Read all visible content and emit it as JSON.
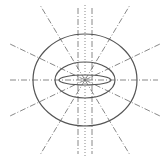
{
  "diagram": {
    "title": "",
    "colors": {
      "ellipse_stroke": "#555555",
      "field_line_stroke": "#6a6a6a",
      "background": "#ffffff"
    },
    "center": {
      "x": 85,
      "y": 80
    },
    "ellipses": [
      {
        "name": "outer-ellipse",
        "rx": 52,
        "ry": 46
      },
      {
        "name": "middle-ellipse",
        "rx": 30,
        "ry": 18
      },
      {
        "name": "inner-ellipse",
        "rx": 26,
        "ry": 5
      }
    ],
    "field_lines": [
      {
        "name": "horizontal-axis",
        "x1": 10,
        "y1": 80,
        "x2": 158,
        "y2": 80,
        "style": "dashdot"
      },
      {
        "name": "ray-upper-left-steep",
        "x1": 85,
        "y1": 80,
        "x2": 40,
        "y2": 5,
        "style": "dashdot"
      },
      {
        "name": "ray-upper-right-steep",
        "x1": 85,
        "y1": 80,
        "x2": 130,
        "y2": 5,
        "style": "dashdot"
      },
      {
        "name": "ray-lower-left-steep",
        "x1": 85,
        "y1": 80,
        "x2": 40,
        "y2": 155,
        "style": "dashdot"
      },
      {
        "name": "ray-lower-right-steep",
        "x1": 85,
        "y1": 80,
        "x2": 130,
        "y2": 155,
        "style": "dashdot"
      },
      {
        "name": "ray-upper-left-shallow",
        "x1": 85,
        "y1": 80,
        "x2": 10,
        "y2": 44,
        "style": "dashdot"
      },
      {
        "name": "ray-upper-right-shallow",
        "x1": 85,
        "y1": 80,
        "x2": 160,
        "y2": 44,
        "style": "dashdot"
      },
      {
        "name": "ray-lower-left-shallow",
        "x1": 85,
        "y1": 80,
        "x2": 10,
        "y2": 116,
        "style": "dashdot"
      },
      {
        "name": "ray-lower-right-shallow",
        "x1": 85,
        "y1": 80,
        "x2": 160,
        "y2": 116,
        "style": "dashdot"
      },
      {
        "name": "vertical-left",
        "x1": 78,
        "y1": 8,
        "x2": 78,
        "y2": 154,
        "style": "dashdot"
      },
      {
        "name": "vertical-center",
        "x1": 85,
        "y1": 5,
        "x2": 85,
        "y2": 156,
        "style": "dotted"
      },
      {
        "name": "vertical-right",
        "x1": 92,
        "y1": 8,
        "x2": 92,
        "y2": 154,
        "style": "dashdot"
      }
    ]
  }
}
